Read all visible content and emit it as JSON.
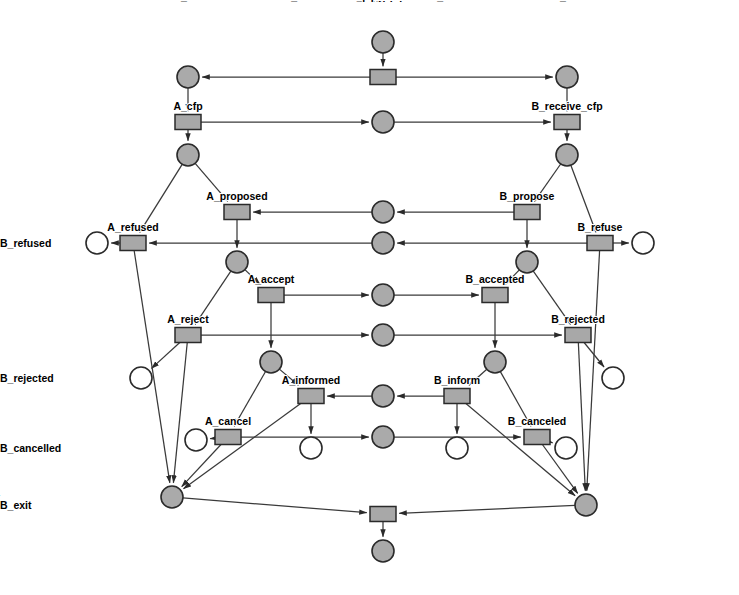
{
  "diagram": {
    "type": "petri-net",
    "colors": {
      "place_filled": "#aaaaaa",
      "place_empty": "#ffffff",
      "transition_fill": "#a8a8a8",
      "stroke": "#2a2a2a",
      "arc": "#3a3a3a",
      "background": "#ffffff"
    },
    "places": [
      {
        "id": "p_pinit",
        "label": "pinit",
        "x": 383,
        "y": 42,
        "r": 11,
        "marked": true,
        "label_pos": "above"
      },
      {
        "id": "p_a_init",
        "label": "A_init",
        "x": 188,
        "y": 77,
        "r": 11,
        "marked": true,
        "label_pos": "above"
      },
      {
        "id": "p_b_init",
        "label": "B_init",
        "x": 567,
        "y": 77,
        "r": 11,
        "marked": true,
        "label_pos": "above"
      },
      {
        "id": "p_cfp",
        "label": "call_for_proposal",
        "x": 383,
        "y": 122,
        "r": 11,
        "marked": true,
        "label_pos": "above"
      },
      {
        "id": "p_a1",
        "label": "",
        "x": 188,
        "y": 155,
        "r": 11,
        "marked": true,
        "label_pos": "none"
      },
      {
        "id": "p_b1",
        "label": "",
        "x": 567,
        "y": 155,
        "r": 11,
        "marked": true,
        "label_pos": "none"
      },
      {
        "id": "p_propose",
        "label": "propose",
        "x": 383,
        "y": 212,
        "r": 11,
        "marked": true,
        "label_pos": "above"
      },
      {
        "id": "p_refuse",
        "label": "refuse",
        "x": 383,
        "y": 243,
        "r": 11,
        "marked": true,
        "label_pos": "above"
      },
      {
        "id": "p_a_refused_place",
        "label": "A_refused",
        "x": 97,
        "y": 243,
        "r": 11,
        "marked": false,
        "label_pos": "left"
      },
      {
        "id": "p_b_refused_place",
        "label": "B_refused",
        "x": 643,
        "y": 243,
        "r": 11,
        "marked": false,
        "label_pos": "right"
      },
      {
        "id": "p_a2",
        "label": "",
        "x": 237,
        "y": 262,
        "r": 11,
        "marked": true,
        "label_pos": "none"
      },
      {
        "id": "p_b2",
        "label": "",
        "x": 527,
        "y": 262,
        "r": 11,
        "marked": true,
        "label_pos": "none"
      },
      {
        "id": "p_accept",
        "label": "accept",
        "x": 383,
        "y": 295,
        "r": 11,
        "marked": true,
        "label_pos": "above"
      },
      {
        "id": "p_reject",
        "label": "reject",
        "x": 383,
        "y": 335,
        "r": 11,
        "marked": true,
        "label_pos": "above"
      },
      {
        "id": "p_a_rejected_place",
        "label": "A_rejected",
        "x": 141,
        "y": 378,
        "r": 11,
        "marked": false,
        "label_pos": "left"
      },
      {
        "id": "p_b_rejected_place",
        "label": "B_rejected",
        "x": 613,
        "y": 378,
        "r": 11,
        "marked": false,
        "label_pos": "right"
      },
      {
        "id": "p_a3",
        "label": "",
        "x": 271,
        "y": 362,
        "r": 11,
        "marked": true,
        "label_pos": "none"
      },
      {
        "id": "p_b3",
        "label": "",
        "x": 495,
        "y": 362,
        "r": 11,
        "marked": true,
        "label_pos": "none"
      },
      {
        "id": "p_inform",
        "label": "inform",
        "x": 383,
        "y": 396,
        "r": 11,
        "marked": true,
        "label_pos": "above"
      },
      {
        "id": "p_cancel",
        "label": "cancel",
        "x": 383,
        "y": 437,
        "r": 11,
        "marked": true,
        "label_pos": "above"
      },
      {
        "id": "p_a_cancelled_place",
        "label": "A_cancelled",
        "x": 196,
        "y": 440,
        "r": 11,
        "marked": false,
        "label_pos": "left"
      },
      {
        "id": "p_b_cancelled_place",
        "label": "B_cancelled",
        "x": 566,
        "y": 448,
        "r": 11,
        "marked": false,
        "label_pos": "right"
      },
      {
        "id": "p_a_success",
        "label": "A_success",
        "x": 311,
        "y": 448,
        "r": 11,
        "marked": false,
        "label_pos": "below"
      },
      {
        "id": "p_b_success",
        "label": "B_success",
        "x": 457,
        "y": 448,
        "r": 11,
        "marked": false,
        "label_pos": "below"
      },
      {
        "id": "p_a_exit",
        "label": "A_exit",
        "x": 172,
        "y": 497,
        "r": 11,
        "marked": true,
        "label_pos": "left"
      },
      {
        "id": "p_b_exit",
        "label": "B_exit",
        "x": 586,
        "y": 505,
        "r": 11,
        "marked": true,
        "label_pos": "right"
      },
      {
        "id": "p_pexit",
        "label": "pexit",
        "x": 383,
        "y": 551,
        "r": 11,
        "marked": true,
        "label_pos": "above"
      }
    ],
    "transitions": [
      {
        "id": "t_init",
        "label": "",
        "x": 383,
        "y": 77,
        "w": 26,
        "h": 15,
        "label_pos": "none"
      },
      {
        "id": "t_a_cfp",
        "label": "A_cfp",
        "x": 188,
        "y": 122,
        "w": 26,
        "h": 15,
        "label_pos": "above"
      },
      {
        "id": "t_b_receive_cfp",
        "label": "B_receive_cfp",
        "x": 567,
        "y": 122,
        "w": 26,
        "h": 15,
        "label_pos": "above"
      },
      {
        "id": "t_a_proposed",
        "label": "A_proposed",
        "x": 237,
        "y": 212,
        "w": 26,
        "h": 15,
        "label_pos": "above"
      },
      {
        "id": "t_b_propose",
        "label": "B_propose",
        "x": 527,
        "y": 212,
        "w": 26,
        "h": 15,
        "label_pos": "above"
      },
      {
        "id": "t_a_refused",
        "label": "A_refused",
        "x": 133,
        "y": 243,
        "w": 26,
        "h": 15,
        "label_pos": "above"
      },
      {
        "id": "t_b_refuse",
        "label": "B_refuse",
        "x": 600,
        "y": 243,
        "w": 26,
        "h": 15,
        "label_pos": "above"
      },
      {
        "id": "t_a_accept",
        "label": "A_accept",
        "x": 271,
        "y": 295,
        "w": 26,
        "h": 15,
        "label_pos": "above"
      },
      {
        "id": "t_b_accepted",
        "label": "B_accepted",
        "x": 495,
        "y": 295,
        "w": 26,
        "h": 15,
        "label_pos": "above"
      },
      {
        "id": "t_a_reject",
        "label": "A_reject",
        "x": 188,
        "y": 335,
        "w": 26,
        "h": 15,
        "label_pos": "above"
      },
      {
        "id": "t_b_rejected",
        "label": "B_rejected",
        "x": 578,
        "y": 335,
        "w": 26,
        "h": 15,
        "label_pos": "above"
      },
      {
        "id": "t_a_informed",
        "label": "A_informed",
        "x": 311,
        "y": 396,
        "w": 26,
        "h": 15,
        "label_pos": "above"
      },
      {
        "id": "t_b_inform",
        "label": "B_inform",
        "x": 457,
        "y": 396,
        "w": 26,
        "h": 15,
        "label_pos": "above"
      },
      {
        "id": "t_a_cancel",
        "label": "A_cancel",
        "x": 228,
        "y": 437,
        "w": 26,
        "h": 15,
        "label_pos": "above"
      },
      {
        "id": "t_b_canceled",
        "label": "B_canceled",
        "x": 537,
        "y": 437,
        "w": 26,
        "h": 15,
        "label_pos": "above"
      },
      {
        "id": "t_exit",
        "label": "",
        "x": 383,
        "y": 514,
        "w": 26,
        "h": 15,
        "label_pos": "none"
      }
    ],
    "arcs": [
      {
        "from": "p_pinit",
        "to": "t_init",
        "arrow": true
      },
      {
        "from": "t_init",
        "to": "p_a_init",
        "arrow": true
      },
      {
        "from": "t_init",
        "to": "p_b_init",
        "arrow": true
      },
      {
        "from": "p_a_init",
        "to": "t_a_cfp",
        "arrow": true
      },
      {
        "from": "t_a_cfp",
        "to": "p_cfp",
        "arrow": true
      },
      {
        "from": "p_cfp",
        "to": "t_b_receive_cfp",
        "arrow": true
      },
      {
        "from": "p_b_init",
        "to": "t_b_receive_cfp",
        "arrow": true
      },
      {
        "from": "t_a_cfp",
        "to": "p_a1",
        "arrow": true
      },
      {
        "from": "t_b_receive_cfp",
        "to": "p_b1",
        "arrow": true
      },
      {
        "from": "p_b1",
        "to": "t_b_propose",
        "arrow": true
      },
      {
        "from": "p_b1",
        "to": "t_b_refuse",
        "arrow": true
      },
      {
        "from": "t_b_propose",
        "to": "p_propose",
        "arrow": true
      },
      {
        "from": "p_propose",
        "to": "t_a_proposed",
        "arrow": true
      },
      {
        "from": "p_a1",
        "to": "t_a_proposed",
        "arrow": true
      },
      {
        "from": "p_a1",
        "to": "t_a_refused",
        "arrow": true
      },
      {
        "from": "t_b_refuse",
        "to": "p_refuse",
        "arrow": true
      },
      {
        "from": "t_b_refuse",
        "to": "p_b_refused_place",
        "arrow": true
      },
      {
        "from": "p_refuse",
        "to": "t_a_refused",
        "arrow": true
      },
      {
        "from": "t_a_refused",
        "to": "p_a_refused_place",
        "arrow": true
      },
      {
        "from": "t_a_proposed",
        "to": "p_a2",
        "arrow": true
      },
      {
        "from": "t_b_propose",
        "to": "p_b2",
        "arrow": true
      },
      {
        "from": "p_a2",
        "to": "t_a_accept",
        "arrow": true
      },
      {
        "from": "p_a2",
        "to": "t_a_reject",
        "arrow": true
      },
      {
        "from": "p_b2",
        "to": "t_b_accepted",
        "arrow": true
      },
      {
        "from": "p_b2",
        "to": "t_b_rejected",
        "arrow": true
      },
      {
        "from": "t_a_accept",
        "to": "p_accept",
        "arrow": true
      },
      {
        "from": "p_accept",
        "to": "t_b_accepted",
        "arrow": true
      },
      {
        "from": "t_a_reject",
        "to": "p_reject",
        "arrow": true
      },
      {
        "from": "p_reject",
        "to": "t_b_rejected",
        "arrow": true
      },
      {
        "from": "t_a_reject",
        "to": "p_a_rejected_place",
        "arrow": true
      },
      {
        "from": "t_b_rejected",
        "to": "p_b_rejected_place",
        "arrow": true
      },
      {
        "from": "t_a_accept",
        "to": "p_a3",
        "arrow": true
      },
      {
        "from": "t_b_accepted",
        "to": "p_b3",
        "arrow": true
      },
      {
        "from": "p_b3",
        "to": "t_b_inform",
        "arrow": true
      },
      {
        "from": "p_b3",
        "to": "t_b_canceled",
        "arrow": true
      },
      {
        "from": "t_b_inform",
        "to": "p_inform",
        "arrow": true
      },
      {
        "from": "p_inform",
        "to": "t_a_informed",
        "arrow": true
      },
      {
        "from": "p_a3",
        "to": "t_a_informed",
        "arrow": true
      },
      {
        "from": "p_a3",
        "to": "t_a_cancel",
        "arrow": true
      },
      {
        "from": "t_a_cancel",
        "to": "p_cancel",
        "arrow": true
      },
      {
        "from": "p_cancel",
        "to": "t_b_canceled",
        "arrow": true
      },
      {
        "from": "t_a_cancel",
        "to": "p_a_cancelled_place",
        "arrow": true
      },
      {
        "from": "t_b_canceled",
        "to": "p_b_cancelled_place",
        "arrow": true
      },
      {
        "from": "t_a_informed",
        "to": "p_a_success",
        "arrow": true
      },
      {
        "from": "t_b_inform",
        "to": "p_b_success",
        "arrow": true
      },
      {
        "from": "t_a_refused",
        "to": "p_a_exit",
        "arrow": true
      },
      {
        "from": "t_a_reject",
        "to": "p_a_exit",
        "arrow": true
      },
      {
        "from": "t_a_cancel",
        "to": "p_a_exit",
        "arrow": true
      },
      {
        "from": "t_a_informed",
        "to": "p_a_exit",
        "arrow": true
      },
      {
        "from": "t_b_refuse",
        "to": "p_b_exit",
        "arrow": true
      },
      {
        "from": "t_b_rejected",
        "to": "p_b_exit",
        "arrow": true
      },
      {
        "from": "t_b_canceled",
        "to": "p_b_exit",
        "arrow": true
      },
      {
        "from": "t_b_inform",
        "to": "p_b_exit",
        "arrow": true
      },
      {
        "from": "p_a_exit",
        "to": "t_exit",
        "arrow": true
      },
      {
        "from": "p_b_exit",
        "to": "t_exit",
        "arrow": true
      },
      {
        "from": "t_exit",
        "to": "p_pexit",
        "arrow": true
      }
    ]
  }
}
